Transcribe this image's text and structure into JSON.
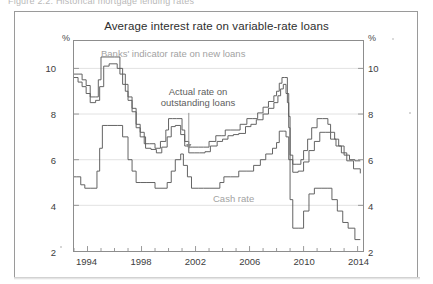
{
  "figure": {
    "caption_sliver": "Figure 2.2: Historical mortgage lending rates",
    "title": "Average interest rate on variable-rate loans"
  },
  "axes": {
    "left_unit": "%",
    "right_unit": "%",
    "y_ticks": [
      2,
      4,
      6,
      8,
      10
    ],
    "y_min": 2,
    "y_max": 11.2,
    "x_ticks": [
      1994,
      1998,
      2002,
      2006,
      2010,
      2014
    ],
    "x_min": 1993,
    "x_max": 2014.4,
    "x_minor_step": 1
  },
  "annotations": {
    "indicator_label": "Banks' indicator rate on new loans",
    "actual_label_line1": "Actual rate on",
    "actual_label_line2": "outstanding loans",
    "cash_label": "Cash rate",
    "arrow": {
      "x": 2001.5,
      "y_from": 8.05,
      "y_to": 6.45
    }
  },
  "colors": {
    "frame": "#8d8d8d",
    "outer_border": "#9a9a9a",
    "line": "#5a5a5a",
    "grid": "#e2e2e2",
    "label_muted": "#a2a2a2",
    "text": "#3d3d3d"
  },
  "chart_data": {
    "type": "line",
    "title": "Average interest rate on variable-rate loans",
    "xlabel": "",
    "ylabel": "%",
    "xlim": [
      1993,
      2014.4
    ],
    "ylim": [
      2,
      11.2
    ],
    "grid": true,
    "legend": "inline-labels",
    "step": "stepped",
    "series": [
      {
        "name": "Banks' indicator rate on new loans",
        "x": [
          1993.0,
          1993.3,
          1993.6,
          1993.9,
          1994.2,
          1994.6,
          1994.8,
          1995.0,
          1995.3,
          1996.0,
          1996.4,
          1996.8,
          1997.0,
          1997.3,
          1997.6,
          1997.9,
          1998.2,
          1998.6,
          1999.0,
          1999.4,
          1999.8,
          2000.0,
          2000.3,
          2000.6,
          2001.0,
          2001.2,
          2001.5,
          2001.8,
          2002.2,
          2002.6,
          2003.0,
          2003.5,
          2003.9,
          2004.2,
          2004.6,
          2005.0,
          2005.3,
          2005.8,
          2006.2,
          2006.6,
          2007.0,
          2007.4,
          2007.8,
          2008.0,
          2008.2,
          2008.4,
          2008.6,
          2008.8,
          2008.9,
          2009.0,
          2009.2,
          2009.5,
          2009.8,
          2010.0,
          2010.3,
          2010.6,
          2011.0,
          2011.4,
          2011.8,
          2012.0,
          2012.3,
          2012.6,
          2013.0,
          2013.4,
          2013.8,
          2014.2
        ],
        "y": [
          9.75,
          9.75,
          9.5,
          9.25,
          8.75,
          8.75,
          9.5,
          10.5,
          10.5,
          10.5,
          9.75,
          9.0,
          8.75,
          8.25,
          7.55,
          7.2,
          6.7,
          6.7,
          6.5,
          6.8,
          7.3,
          7.8,
          7.8,
          7.8,
          7.3,
          6.8,
          6.55,
          6.55,
          6.55,
          6.55,
          6.8,
          7.05,
          7.05,
          7.3,
          7.3,
          7.3,
          7.55,
          7.8,
          7.8,
          8.05,
          8.3,
          8.55,
          8.8,
          9.0,
          9.35,
          9.6,
          9.6,
          8.5,
          7.4,
          6.0,
          5.8,
          5.8,
          6.0,
          6.4,
          6.9,
          7.4,
          7.8,
          7.8,
          7.55,
          7.2,
          6.9,
          6.6,
          6.2,
          6.0,
          5.95,
          5.95
        ]
      },
      {
        "name": "Actual rate on outstanding loans",
        "x": [
          1993.0,
          1993.3,
          1993.6,
          1993.9,
          1994.2,
          1994.6,
          1994.9,
          1995.2,
          1995.6,
          1996.2,
          1996.6,
          1997.0,
          1997.3,
          1997.6,
          1997.9,
          1998.3,
          1998.7,
          1999.1,
          1999.5,
          1999.9,
          2000.2,
          2000.5,
          2000.9,
          2001.2,
          2001.5,
          2001.9,
          2002.3,
          2002.7,
          2003.1,
          2003.6,
          2004.0,
          2004.4,
          2004.8,
          2005.2,
          2005.7,
          2006.1,
          2006.5,
          2007.0,
          2007.4,
          2007.8,
          2008.1,
          2008.3,
          2008.5,
          2008.7,
          2008.9,
          2009.0,
          2009.2,
          2009.6,
          2010.0,
          2010.4,
          2010.8,
          2011.2,
          2011.6,
          2012.0,
          2012.4,
          2012.8,
          2013.2,
          2013.7,
          2014.2
        ],
        "y": [
          9.6,
          9.4,
          9.2,
          8.9,
          8.5,
          8.6,
          9.2,
          10.1,
          10.2,
          10.0,
          9.3,
          8.6,
          8.1,
          7.4,
          7.0,
          6.5,
          6.45,
          6.3,
          6.55,
          7.0,
          7.45,
          7.5,
          7.1,
          6.6,
          6.3,
          6.3,
          6.3,
          6.35,
          6.6,
          6.8,
          6.9,
          7.05,
          7.1,
          7.15,
          7.45,
          7.55,
          7.75,
          8.0,
          8.25,
          8.5,
          8.8,
          9.1,
          9.3,
          8.9,
          7.9,
          6.2,
          5.45,
          5.5,
          5.9,
          6.4,
          6.8,
          7.2,
          7.2,
          6.9,
          6.6,
          6.3,
          5.95,
          5.6,
          5.4
        ]
      },
      {
        "name": "Cash rate",
        "x": [
          1993.0,
          1993.2,
          1993.5,
          1993.8,
          1994.2,
          1994.7,
          1994.9,
          1995.1,
          1995.5,
          1996.2,
          1996.6,
          1997.0,
          1997.3,
          1997.6,
          1997.9,
          1998.4,
          1999.0,
          1999.9,
          2000.2,
          2000.5,
          2000.9,
          2001.1,
          2001.4,
          2001.7,
          2002.2,
          2002.6,
          2003.0,
          2003.8,
          2004.1,
          2004.6,
          2005.2,
          2005.8,
          2006.3,
          2006.8,
          2007.2,
          2007.7,
          2008.0,
          2008.2,
          2008.5,
          2008.7,
          2008.9,
          2009.0,
          2009.2,
          2009.6,
          2010.0,
          2010.4,
          2010.8,
          2011.3,
          2011.8,
          2012.1,
          2012.5,
          2012.9,
          2013.3,
          2013.8,
          2014.2
        ],
        "y": [
          5.25,
          5.25,
          4.9,
          4.75,
          4.75,
          5.5,
          6.5,
          7.5,
          7.5,
          7.5,
          7.0,
          6.0,
          5.5,
          5.0,
          5.0,
          5.0,
          4.75,
          5.0,
          5.5,
          6.0,
          6.25,
          5.75,
          5.25,
          4.75,
          4.75,
          4.75,
          4.75,
          5.0,
          5.25,
          5.25,
          5.5,
          5.5,
          5.75,
          6.0,
          6.25,
          6.5,
          6.75,
          7.25,
          7.25,
          7.0,
          6.0,
          4.25,
          3.0,
          3.0,
          3.75,
          4.5,
          4.75,
          4.75,
          4.75,
          4.25,
          3.75,
          3.25,
          3.0,
          2.5,
          2.5
        ]
      }
    ]
  }
}
